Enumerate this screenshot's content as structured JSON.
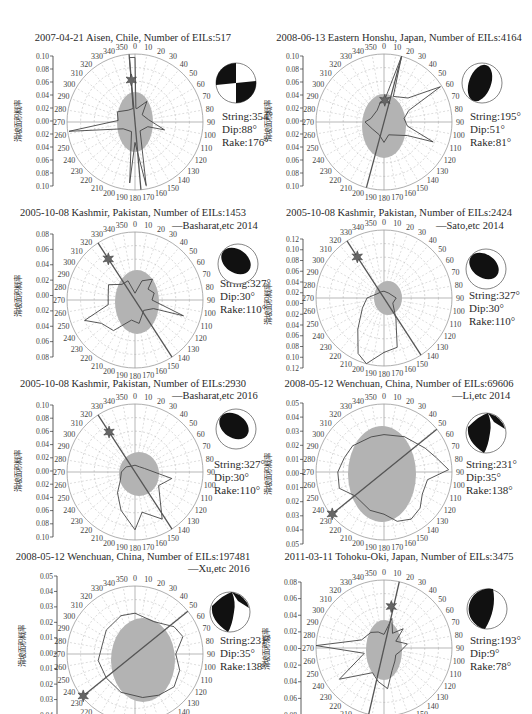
{
  "figure": {
    "y_axis_label": "滑坡面积概率",
    "angle_labels": [
      "0",
      "10",
      "20",
      "30",
      "40",
      "50",
      "60",
      "70",
      "80",
      "90",
      "100",
      "110",
      "120",
      "130",
      "140",
      "150",
      "160",
      "170",
      "180",
      "190",
      "200",
      "210",
      "220",
      "230",
      "240",
      "250",
      "260",
      "270",
      "280",
      "290",
      "300",
      "310",
      "320",
      "330",
      "340",
      "350"
    ],
    "colors": {
      "fill": "#b3b3b3",
      "line": "#444444",
      "grid": "#bdbdbd",
      "beachball": "#111111"
    }
  },
  "panels": [
    {
      "title": "2007-04-21 Aisen, Chile, Number of EILs:517",
      "ref": "",
      "params": [
        "String:354°",
        "Dip:88°",
        "Rake:176°"
      ],
      "yticks": [
        "0.10",
        "0.08",
        "0.06",
        "0.04",
        "0.02",
        "0.00",
        "0.02",
        "0.04",
        "0.06",
        "0.08",
        "0.10"
      ]
    },
    {
      "title": "2008-06-13 Eastern Honshu, Japan, Number of EILs:4164",
      "ref": "",
      "params": [
        "String:195°",
        "Dip:51°",
        "Rake:81°"
      ],
      "yticks": [
        "0.10",
        "0.08",
        "0.06",
        "0.04",
        "0.02",
        "0.00",
        "0.02",
        "0.04",
        "0.06",
        "0.08",
        "0.10"
      ]
    },
    {
      "title": "2005-10-08 Kashmir, Pakistan, Number of EILs:1453",
      "ref": "—Basharat,etc 2014",
      "params": [
        "String:327°",
        "Dip:30°",
        "Rake:110°"
      ],
      "yticks": [
        "0.08",
        "0.06",
        "0.04",
        "0.02",
        "0.00",
        "0.02",
        "0.04",
        "0.06",
        "0.08"
      ]
    },
    {
      "title": "2005-10-08 Kashmir, Pakistan, Number of EILs:2424",
      "ref": "—Sato,etc 2014",
      "params": [
        "String:327°",
        "Dip:30°",
        "Rake:110°"
      ],
      "yticks": [
        "0.12",
        "0.10",
        "0.08",
        "0.06",
        "0.04",
        "0.02",
        "0.00",
        "0.02",
        "0.04",
        "0.06",
        "0.08",
        "0.10",
        "0.12"
      ]
    },
    {
      "title": "2005-10-08 Kashmir, Pakistan, Number of EILs:2930",
      "ref": "—Basharat,etc 2016",
      "params": [
        "String:327°",
        "Dip:30°",
        "Rake:110°"
      ],
      "yticks": [
        "0.10",
        "0.08",
        "0.06",
        "0.04",
        "0.02",
        "0.00",
        "0.02",
        "0.04",
        "0.06",
        "0.08",
        "0.10"
      ]
    },
    {
      "title": "2008-05-12 Wenchuan, China, Number of EILs:69606",
      "ref": "—Li,etc 2014",
      "params": [
        "String:231°",
        "Dip:35°",
        "Rake:138°"
      ],
      "yticks": [
        "0.05",
        "0.04",
        "0.03",
        "0.02",
        "0.01",
        "0.00",
        "0.01",
        "0.02",
        "0.03",
        "0.04",
        "0.05"
      ]
    },
    {
      "title": "2008-05-12 Wenchuan, China, Number of EILs:197481",
      "ref": "—Xu,etc 2016",
      "params": [
        "String:231°",
        "Dip:35°",
        "Rake:138°"
      ],
      "yticks": [
        "0.05",
        "0.04",
        "0.03",
        "0.02",
        "0.01",
        "0.00",
        "0.01",
        "0.02",
        "0.03",
        "0.04"
      ]
    },
    {
      "title": "2011-03-11 Tohoku-Oki, Japan, Number of EILs:3475",
      "ref": "",
      "params": [
        "String:193°",
        "Dip:9°",
        "Rake:78°"
      ],
      "yticks": [
        "0.08",
        "0.06",
        "0.04",
        "0.02",
        "0.00",
        "0.02",
        "0.04",
        "0.06",
        "0.08"
      ]
    }
  ],
  "chart_data": [
    {
      "type": "polar-rose",
      "title": "2007-04-21 Aisen, Chile, Number of EILs:517",
      "ylabel": "滑坡面积概率",
      "rlim": [
        0,
        0.1
      ],
      "fault": {
        "strike": 354,
        "dip": 88,
        "rake": 176
      },
      "dominant_directions_deg": [
        355,
        5,
        262,
        170,
        185
      ]
    },
    {
      "title": "2008-06-13 Eastern Honshu, Japan, Number of EILs:4164",
      "type": "polar-rose",
      "ylabel": "滑坡面积概率",
      "rlim": [
        0,
        0.1
      ],
      "fault": {
        "strike": 195,
        "dip": 51,
        "rake": 81
      },
      "dominant_directions_deg": [
        15,
        58,
        112
      ]
    },
    {
      "title": "2005-10-08 Kashmir, Pakistan, Number of EILs:1453",
      "type": "polar-rose",
      "source": "Basharat,etc 2014",
      "ylabel": "滑坡面积概率",
      "rlim": [
        0,
        0.08
      ],
      "fault": {
        "strike": 327,
        "dip": 30,
        "rake": 110
      },
      "dominant_directions_deg": [
        108,
        248,
        235
      ]
    },
    {
      "title": "2005-10-08 Kashmir, Pakistan, Number of EILs:2424",
      "type": "polar-rose",
      "source": "Sato,etc 2014",
      "ylabel": "滑坡面积概率",
      "rlim": [
        0,
        0.12
      ],
      "fault": {
        "strike": 327,
        "dip": 30,
        "rake": 110
      },
      "dominant_directions_deg": [
        195,
        180
      ]
    },
    {
      "title": "2005-10-08 Kashmir, Pakistan, Number of EILs:2930",
      "type": "polar-rose",
      "source": "Basharat,etc 2016",
      "ylabel": "滑坡面积概率",
      "rlim": [
        0,
        0.1
      ],
      "fault": {
        "strike": 327,
        "dip": 30,
        "rake": 110
      },
      "dominant_directions_deg": [
        100,
        170,
        190
      ]
    },
    {
      "title": "2008-05-12 Wenchuan, China, Number of EILs:69606",
      "type": "polar-rose",
      "source": "Li,etc 2014",
      "ylabel": "滑坡面积概率",
      "rlim": [
        0,
        0.05
      ],
      "fault": {
        "strike": 231,
        "dip": 35,
        "rake": 138
      },
      "dominant_directions_deg": [
        88,
        150
      ]
    },
    {
      "title": "2008-05-12 Wenchuan, China, Number of EILs:197481",
      "type": "polar-rose",
      "source": "Xu,etc 2016",
      "ylabel": "滑坡面积概率",
      "rlim": [
        0,
        0.05
      ],
      "fault": {
        "strike": 231,
        "dip": 35,
        "rake": 138
      },
      "dominant_directions_deg": [
        70,
        135
      ]
    },
    {
      "title": "2011-03-11 Tohoku-Oki, Japan, Number of EILs:3475",
      "type": "polar-rose",
      "ylabel": "滑坡面积概率",
      "rlim": [
        0,
        0.08
      ],
      "fault": {
        "strike": 193,
        "dip": 9,
        "rake": 78
      },
      "dominant_directions_deg": [
        272,
        235,
        200
      ]
    }
  ]
}
